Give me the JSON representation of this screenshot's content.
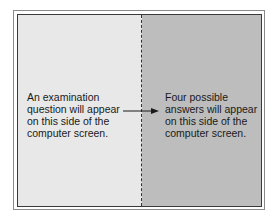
{
  "figure": {
    "left_panel": {
      "label": "question-side",
      "text": "An examination\nquestion will appear\non this side of the\ncomputer screen.",
      "color": "#e8e8e8"
    },
    "right_panel": {
      "label": "answer-side",
      "text": "Four possible\nanswers will appear\non this side of the\ncomputer screen.",
      "color": "#bdbdbd"
    },
    "divider": {
      "style": "dashed"
    },
    "arrow": {
      "direction": "left-to-right",
      "icon": "arrow-right-icon"
    }
  }
}
